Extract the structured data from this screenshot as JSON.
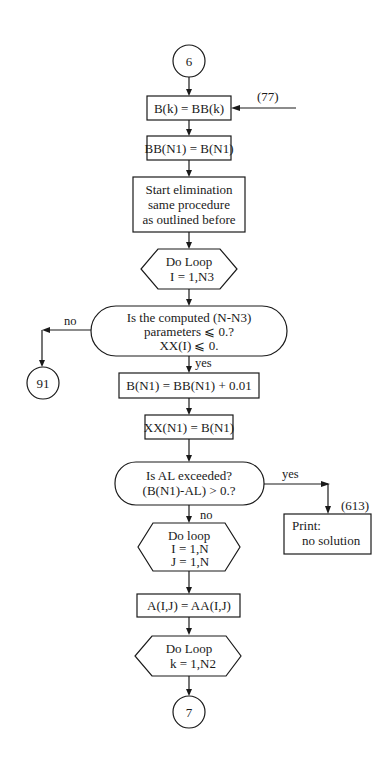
{
  "diagram": {
    "type": "flowchart",
    "connectors": {
      "start": "6",
      "end": "7",
      "no_branch_target": "91"
    },
    "entry_label": "(77)",
    "print_box_label": "(613)",
    "nodes": {
      "assign_b": "B(k) = BB(k)",
      "assign_bb": "BB(N1) = B(N1)",
      "elim_line1": "Start elimination",
      "elim_line2": "same procedure",
      "elim_line3": "as outlined before",
      "loop1_line1": "Do Loop",
      "loop1_line2": "I = 1,N3",
      "decision1_line1": "Is the computed (N-N3)",
      "decision1_line2": "parameters ⩽ 0.?",
      "decision1_line3": "XX(I) ⩽ 0.",
      "increment": "B(N1) = BB(N1) + 0.01",
      "assign_xx": "XX(N1) = B(N1)",
      "decision2_line1": "Is AL exceeded?",
      "decision2_line2": "(B(N1)-AL) > 0.?",
      "loop2_line1": "Do loop",
      "loop2_line2": "I = 1,N",
      "loop2_line3": "J = 1,N",
      "assign_a": "A(I,J) = AA(I,J)",
      "loop3_line1": "Do Loop",
      "loop3_line2": "k = 1,N2",
      "print_line1": "Print:",
      "print_line2": "no solution"
    },
    "edge_labels": {
      "decision1_no": "no",
      "decision1_yes": "yes",
      "decision2_yes": "yes",
      "decision2_no": "no"
    }
  }
}
